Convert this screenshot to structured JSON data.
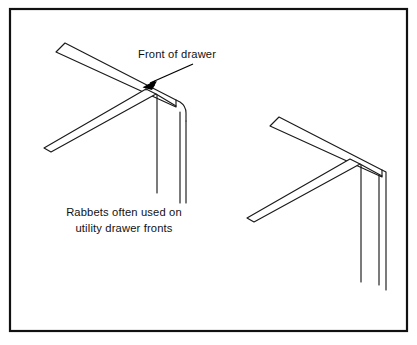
{
  "figure": {
    "name": "rabbet-drawer-corner-joint-illustration",
    "background_color": "#ffffff",
    "line_color": "#1a1a1a",
    "border_color": "#111111",
    "width": 417,
    "height": 345
  },
  "border": {
    "x": 10,
    "y": 9,
    "width": 397,
    "height": 322,
    "stroke_width": 2.2
  },
  "callout": {
    "label": "Front of drawer",
    "text_x": 138,
    "text_y": 58,
    "leader": {
      "start_x": 193,
      "start_y": 64,
      "end_x": 145,
      "end_y": 86
    }
  },
  "caption": {
    "line1": "Rabbets often used on",
    "line2": "utility drawer  fronts",
    "center_x": 124,
    "line1_y": 216,
    "line2_y": 232
  },
  "joints": [
    {
      "name": "left-joint",
      "corner_style": "rounded",
      "description": "Rabbeted drawer corner, front arm to upper right, side arm to lower left"
    },
    {
      "name": "right-joint",
      "corner_style": "square",
      "description": "Rabbeted drawer corner, front arm to upper left, side arm to lower left"
    }
  ]
}
